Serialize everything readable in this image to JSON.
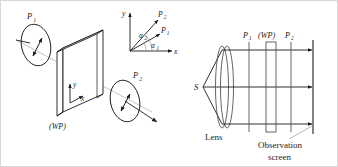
{
  "figure": {
    "background_color": "#ffffff",
    "stroke_color": "#1a1a1a",
    "faint_stroke_color": "#9a9a9a"
  },
  "left_panel": {
    "name": "perspective-view",
    "polarizer_1_label": "P",
    "polarizer_1_sub": "1",
    "polarizer_2_label": "P",
    "polarizer_2_sub": "2",
    "wave_plate_label": "(WP)",
    "axis_y_label": "y",
    "axis_x_label": "x"
  },
  "inset_axes": {
    "name": "angle-inset",
    "y_label": "y",
    "x_label": "x",
    "vector_1_label": "P",
    "vector_1_sub": "1",
    "vector_2_label": "P",
    "vector_2_sub": "2",
    "angle_1_label": "α",
    "angle_1_sub": "1",
    "angle_2_label": "α",
    "angle_2_sub": "2"
  },
  "right_panel": {
    "name": "optical-bench-view",
    "source_label": "S",
    "lens_label": "Lens",
    "element_1_label": "P",
    "element_1_sub": "1",
    "wave_plate_label": "(WP)",
    "element_2_label": "P",
    "element_2_sub": "2",
    "screen_label_line1": "Observation",
    "screen_label_line2": "screen"
  }
}
